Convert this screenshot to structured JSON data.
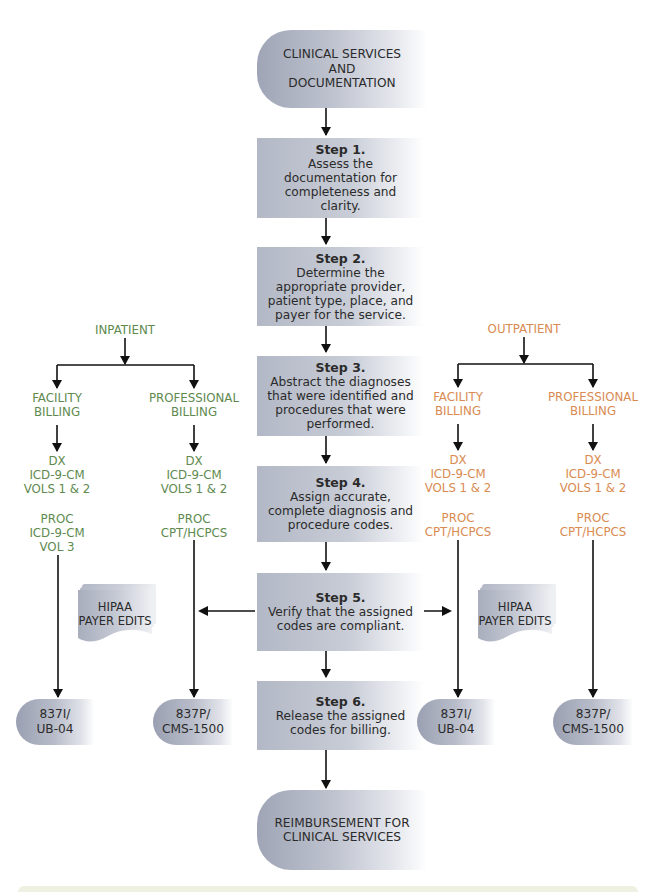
{
  "start": {
    "label": "CLINICAL SERVICES AND DOCUMENTATION",
    "lines": [
      "CLINICAL SERVICES",
      "AND",
      "DOCUMENTATION"
    ]
  },
  "steps": [
    {
      "title": "Step 1.",
      "lines": [
        "Assess the",
        "documentation for",
        "completeness and",
        "clarity."
      ]
    },
    {
      "title": "Step 2.",
      "lines": [
        "Determine the",
        "appropriate provider,",
        "patient type, place, and",
        "payer for the service."
      ]
    },
    {
      "title": "Step 3.",
      "lines": [
        "Abstract the diagnoses",
        "that were identified and",
        "procedures that were",
        "performed."
      ]
    },
    {
      "title": "Step 4.",
      "lines": [
        "Assign accurate,",
        "complete diagnosis and",
        "procedure codes."
      ]
    },
    {
      "title": "Step 5.",
      "lines": [
        "Verify that the assigned",
        "codes are compliant."
      ]
    },
    {
      "title": "Step 6.",
      "lines": [
        "Release the assigned",
        "codes for billing."
      ]
    }
  ],
  "end": {
    "lines": [
      "REIMBURSEMENT FOR",
      "CLINICAL SERVICES"
    ]
  },
  "inpatient": {
    "label": "INPATIENT",
    "color": "#5e8a4f",
    "facility": {
      "billing": [
        "FACILITY",
        "BILLING"
      ],
      "dx": [
        "DX",
        "ICD-9-CM",
        "VOLS 1 & 2"
      ],
      "proc": [
        "PROC",
        "ICD-9-CM",
        "VOL 3"
      ],
      "form": [
        "837I/",
        "UB-04"
      ]
    },
    "professional": {
      "billing": [
        "PROFESSIONAL",
        "BILLING"
      ],
      "dx": [
        "DX",
        "ICD-9-CM",
        "VOLS 1 & 2"
      ],
      "proc": [
        "PROC",
        "CPT/HCPCS"
      ],
      "form": [
        "837P/",
        "CMS-1500"
      ]
    },
    "edits": [
      "HIPAA",
      "PAYER EDITS"
    ]
  },
  "outpatient": {
    "label": "OUTPATIENT",
    "color": "#d98b52",
    "facility": {
      "billing": [
        "FACILITY",
        "BILLING"
      ],
      "dx": [
        "DX",
        "ICD-9-CM",
        "VOLS 1 & 2"
      ],
      "proc": [
        "PROC",
        "CPT/HCPCS"
      ],
      "form": [
        "837I/",
        "UB-04"
      ]
    },
    "professional": {
      "billing": [
        "PROFESSIONAL",
        "BILLING"
      ],
      "dx": [
        "DX",
        "ICD-9-CM",
        "VOLS 1 & 2"
      ],
      "proc": [
        "PROC",
        "CPT/HCPCS"
      ],
      "form": [
        "837P/",
        "CMS-1500"
      ]
    },
    "edits": [
      "HIPAA",
      "PAYER EDITS"
    ]
  }
}
